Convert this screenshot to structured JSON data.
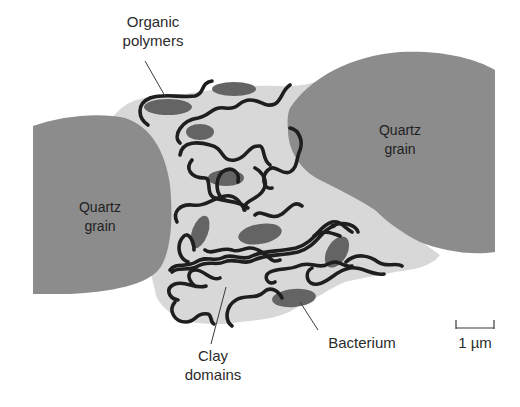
{
  "figure": {
    "type": "schematic"
  },
  "colors": {
    "background": "#ffffff",
    "matrix": "#d8d8d8",
    "quartz_grain": "#8c8c8c",
    "bacterium": "#646464",
    "polymer": "#1e1e1e",
    "text": "#2b2b2b"
  },
  "labels": {
    "organic_polymers": {
      "line1": "Organic",
      "line2": "polymers"
    },
    "quartz_left": {
      "line1": "Quartz",
      "line2": "grain"
    },
    "quartz_right": {
      "line1": "Quartz",
      "line2": "grain"
    },
    "clay_domains": {
      "line1": "Clay",
      "line2": "domains"
    },
    "bacterium": "Bacterium",
    "scale_bar": "1 µm"
  }
}
